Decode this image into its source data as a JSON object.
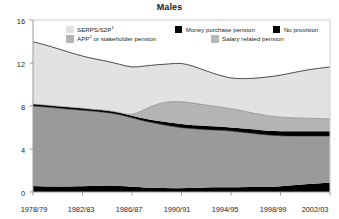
{
  "chart_data": {
    "type": "area",
    "stacked": true,
    "title": "Males",
    "xlabel": "",
    "ylabel": "",
    "ylim": [
      0,
      16
    ],
    "yticks": [
      0,
      4,
      8,
      12,
      16
    ],
    "ytick_labels": [
      "0",
      "4",
      "8",
      "12",
      "16"
    ],
    "grid": false,
    "legend_position": "top-inside",
    "x": [
      "1978/79",
      "1979/80",
      "1980/81",
      "1981/82",
      "1982/83",
      "1983/84",
      "1984/85",
      "1985/86",
      "1986/87",
      "1987/88",
      "1988/89",
      "1989/90",
      "1990/91",
      "1991/92",
      "1992/93",
      "1993/94",
      "1994/95",
      "1995/96",
      "1996/97",
      "1997/98",
      "1998/99",
      "1999/00",
      "2000/01",
      "2001/02",
      "2002/03"
    ],
    "xtick_labels": [
      "1978/79",
      "1982/83",
      "1986/87",
      "1990/91",
      "1994/95",
      "1998/99",
      "2002/03"
    ],
    "xtick_positions": [
      0,
      4,
      8,
      12,
      16,
      20,
      24
    ],
    "series": [
      {
        "name": "No provision",
        "color": "#000000",
        "values": [
          0.55,
          0.52,
          0.5,
          0.52,
          0.55,
          0.58,
          0.6,
          0.58,
          0.5,
          0.42,
          0.38,
          0.36,
          0.35,
          0.38,
          0.42,
          0.45,
          0.45,
          0.45,
          0.46,
          0.48,
          0.52,
          0.62,
          0.72,
          0.8,
          0.88
        ]
      },
      {
        "name": "Salary related pension",
        "color": "#9a9a9a",
        "values": [
          7.45,
          7.38,
          7.3,
          7.18,
          7.05,
          6.92,
          6.8,
          6.62,
          6.4,
          6.18,
          5.98,
          5.8,
          5.62,
          5.5,
          5.38,
          5.3,
          5.22,
          5.1,
          4.95,
          4.82,
          4.7,
          4.58,
          4.48,
          4.4,
          4.32
        ]
      },
      {
        "name": "Money purchase pension",
        "color": "#000000",
        "values": [
          0.18,
          0.18,
          0.18,
          0.18,
          0.18,
          0.18,
          0.18,
          0.18,
          0.18,
          0.22,
          0.28,
          0.32,
          0.34,
          0.34,
          0.33,
          0.33,
          0.34,
          0.36,
          0.38,
          0.4,
          0.42,
          0.44,
          0.45,
          0.46,
          0.46
        ]
      },
      {
        "name": "APP or stakeholder pension",
        "color": "#b4b4b4",
        "values": [
          0.0,
          0.0,
          0.0,
          0.0,
          0.0,
          0.0,
          0.0,
          0.0,
          0.05,
          0.85,
          1.55,
          1.95,
          2.1,
          2.05,
          1.95,
          1.85,
          1.75,
          1.62,
          1.5,
          1.4,
          1.32,
          1.26,
          1.22,
          1.18,
          1.15
        ]
      },
      {
        "name": "SERPS/S2P",
        "color": "#e2e2e2",
        "values": [
          5.8,
          5.6,
          5.35,
          5.1,
          4.85,
          4.7,
          4.58,
          4.5,
          4.45,
          4.05,
          3.65,
          3.48,
          3.6,
          3.42,
          3.18,
          2.95,
          2.82,
          3.0,
          3.3,
          3.6,
          3.9,
          4.2,
          4.45,
          4.66,
          4.82
        ]
      }
    ],
    "totals": [
      14.0,
      13.68,
      13.33,
      12.98,
      12.63,
      12.38,
      12.16,
      11.88,
      11.58,
      11.72,
      11.84,
      11.91,
      12.01,
      11.69,
      11.26,
      10.88,
      10.58,
      10.53,
      10.59,
      10.7,
      10.86,
      11.1,
      11.32,
      11.5,
      11.63
    ]
  },
  "title": "Males",
  "legend": {
    "items": [
      {
        "key": "serps",
        "label": "SERPS/S2P",
        "sup": "1",
        "color": "#e2e2e2"
      },
      {
        "key": "mpp",
        "label": "Money purchase pension",
        "sup": "",
        "color": "#000000"
      },
      {
        "key": "nopro",
        "label": "No provision",
        "sup": "",
        "color": "#000000"
      },
      {
        "key": "app",
        "label": "APP",
        "sup": "2",
        "color": "#b4b4b4",
        "label_tail": " or stakeholder pension"
      },
      {
        "key": "salary",
        "label": "Salary related pension",
        "sup": "",
        "color": "#b8b8b8"
      }
    ]
  },
  "axes": {
    "y_labels": [
      "16",
      "12",
      "8",
      "4",
      "0"
    ],
    "x_labels": [
      "1978/79",
      "1982/83",
      "1986/87",
      "1990/91",
      "1994/95",
      "1998/99",
      "2002/03"
    ]
  },
  "colors": {
    "serps": "#e2e2e2",
    "app": "#b4b4b4",
    "salary": "#9a9a9a",
    "money_purchase": "#000000",
    "no_provision": "#000000",
    "axis": "#9b9b9b",
    "outline": "#3a3a3a",
    "text": "#231f20"
  }
}
